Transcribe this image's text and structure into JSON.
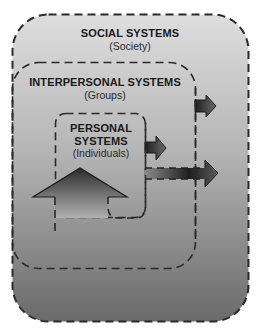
{
  "diagram": {
    "social": {
      "title": "SOCIAL SYSTEMS",
      "subtitle": "(Society)"
    },
    "interpersonal": {
      "title": "INTERPERSONAL SYSTEMS",
      "subtitle": "(Groups)"
    },
    "personal": {
      "title_line1": "PERSONAL",
      "title_line2": "SYSTEMS",
      "subtitle": "(Individuals)"
    }
  },
  "colors": {
    "gradient_top": "#dcdcdc",
    "gradient_bottom": "#6e6e6e",
    "dash": "#2a2a2a",
    "arrow_dark": "#222222",
    "arrow_light": "#9a9a9a"
  }
}
